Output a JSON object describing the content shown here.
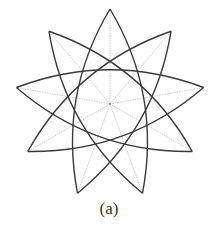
{
  "figure": {
    "caption": "(a)",
    "shape": "nine-pointed star formed by curved arcs",
    "points": 9,
    "skip": 4,
    "center": [
      110,
      104
    ],
    "radius": 95,
    "control_radius": 52,
    "arc_color": "#3a3a3a",
    "guide_color": "#b8b8b8"
  }
}
